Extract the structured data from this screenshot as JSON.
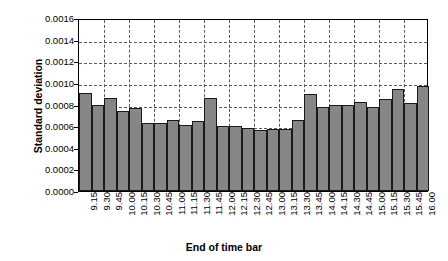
{
  "chart_data": {
    "type": "bar",
    "title": "",
    "xlabel": "End of time bar",
    "ylabel": "Standard deviation",
    "ylim": [
      0.0,
      0.0016
    ],
    "ytick_labels": [
      "0.0016",
      "0.0014",
      "0.0012",
      "0.0010",
      "0.0008",
      "0.0006",
      "0.0004",
      "0.0002",
      "0.0000"
    ],
    "ytick_values": [
      0.0016,
      0.0014,
      0.0012,
      0.001,
      0.0008,
      0.0006,
      0.0004,
      0.0002,
      0.0
    ],
    "grid": "horizontal-and-vertical-dashed",
    "legend": "none",
    "bar_color": "#868686",
    "bar_edge_color": "#1a1a1a",
    "categories": [
      "9.15",
      "9.30",
      "9.45",
      "10.00",
      "10.15",
      "10.30",
      "10.45",
      "11.00",
      "11.15",
      "11.30",
      "11.45",
      "12.00",
      "12.15",
      "12.30",
      "12.45",
      "13.00",
      "13.15",
      "13.30",
      "13.45",
      "14.00",
      "14.15",
      "14.30",
      "14.45",
      "15.00",
      "15.15",
      "15.30",
      "15.45",
      "16.00"
    ],
    "values": [
      0.00091,
      0.0008,
      0.00086,
      0.00074,
      0.00077,
      0.00063,
      0.00063,
      0.00066,
      0.00061,
      0.00065,
      0.00086,
      0.0006,
      0.0006,
      0.00058,
      0.00056,
      0.00057,
      0.00057,
      0.00066,
      0.0009,
      0.00078,
      0.0008,
      0.0008,
      0.00082,
      0.00078,
      0.00085,
      0.00094,
      0.00081,
      0.00097
    ]
  }
}
